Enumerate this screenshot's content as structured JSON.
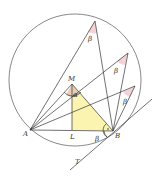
{
  "diagram": {
    "labels": {
      "A": "A",
      "B": "B",
      "L": "L",
      "M": "M",
      "T": "T",
      "alpha": "α",
      "beta1": "β",
      "beta2": "β",
      "beta3": "β",
      "beta4": "β"
    },
    "colors": {
      "stroke": "#333333",
      "triangle_fill": "#fbf3b0",
      "angle_fill_pink": "#f4d2d8",
      "angle_fill_tan": "#e8cdb5",
      "background": "#ffffff"
    },
    "circle": {
      "cx": 75,
      "cy": 80,
      "r": 66
    }
  }
}
